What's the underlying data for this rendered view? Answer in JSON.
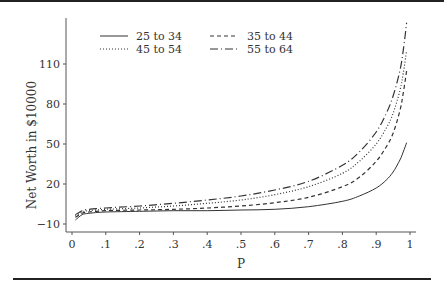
{
  "chart_data": {
    "type": "line",
    "title": "",
    "xlabel": "P",
    "ylabel": "Net Worth in $10000",
    "xlim": [
      0,
      1
    ],
    "ylim": [
      -15,
      150
    ],
    "xticks": [
      0,
      0.1,
      0.2,
      0.3,
      0.4,
      0.5,
      0.6,
      0.7,
      0.8,
      0.9,
      1
    ],
    "xtick_labels": [
      "0",
      ".1",
      ".2",
      ".3",
      ".4",
      ".5",
      ".6",
      ".7",
      ".8",
      ".9",
      "1"
    ],
    "yticks": [
      -10,
      20,
      50,
      80,
      110
    ],
    "ytick_labels": [
      "−10",
      "20",
      "50",
      "80",
      "110"
    ],
    "grid": false,
    "legend_position": "top-left, two columns",
    "x": [
      0.01,
      0.03,
      0.05,
      0.1,
      0.2,
      0.3,
      0.4,
      0.5,
      0.6,
      0.7,
      0.8,
      0.85,
      0.9,
      0.93,
      0.95,
      0.97,
      0.98,
      0.99
    ],
    "series": [
      {
        "name": "25 to 34",
        "style": "solid",
        "values": [
          -7,
          -3,
          -2,
          -1,
          -0.5,
          0,
          0,
          0.5,
          1,
          3,
          7,
          11,
          17,
          23,
          29,
          38,
          44,
          51
        ]
      },
      {
        "name": "35 to 44",
        "style": "dashed",
        "values": [
          -5,
          -2,
          -1,
          0,
          0.5,
          1,
          2,
          3.5,
          6,
          10,
          18,
          25,
          37,
          48,
          58,
          75,
          88,
          105
        ]
      },
      {
        "name": "45 to 54",
        "style": "dotted",
        "values": [
          -4,
          -1,
          0,
          1,
          2,
          3.5,
          5.5,
          8,
          12,
          18,
          28,
          37,
          50,
          62,
          73,
          90,
          103,
          120
        ]
      },
      {
        "name": "55 to 64",
        "style": "dash-dot",
        "values": [
          -3,
          0,
          1,
          2,
          3.5,
          5.5,
          8,
          11,
          15.5,
          22,
          34,
          44,
          59,
          73,
          86,
          105,
          120,
          141
        ]
      }
    ]
  },
  "legend": {
    "items": [
      {
        "label": "25 to 34",
        "style": "solid"
      },
      {
        "label": "35 to 44",
        "style": "dashed"
      },
      {
        "label": "45 to 54",
        "style": "dotted"
      },
      {
        "label": "55 to 64",
        "style": "dash-dot"
      }
    ]
  },
  "axes": {
    "x_title": "P",
    "y_title": "Net Worth in $10000"
  },
  "colors": {
    "line": "#333333",
    "axis": "#555555",
    "rule": "#222222"
  }
}
